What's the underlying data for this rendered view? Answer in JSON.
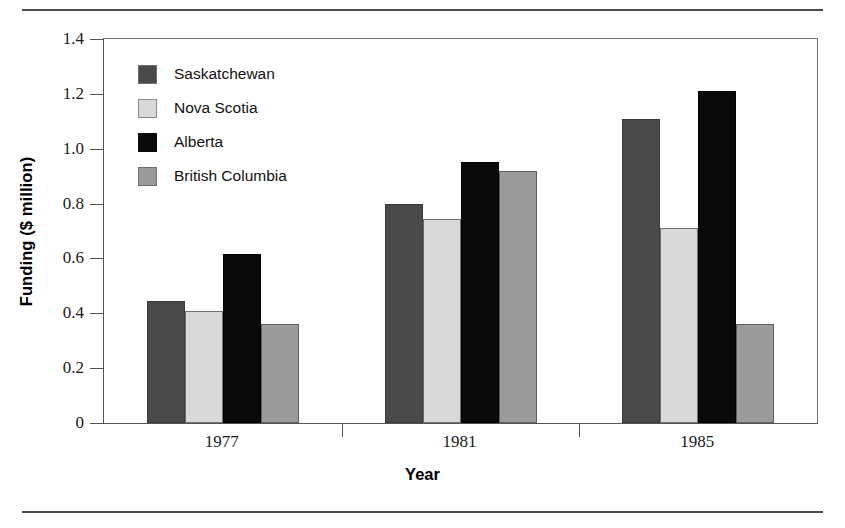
{
  "chart_data": {
    "type": "bar",
    "title": "",
    "xlabel": "Year",
    "ylabel": "Funding ($ million)",
    "categories": [
      "1977",
      "1981",
      "1985"
    ],
    "series": [
      {
        "name": "Saskatchewan",
        "color": "#4a4a4a",
        "values": [
          0.445,
          0.8,
          1.11
        ]
      },
      {
        "name": "Nova Scotia",
        "color": "#d9d9d9",
        "values": [
          0.41,
          0.745,
          0.71
        ]
      },
      {
        "name": "Alberta",
        "color": "#0a0a0a",
        "values": [
          0.615,
          0.95,
          1.21
        ]
      },
      {
        "name": "British Columbia",
        "color": "#9b9b9b",
        "values": [
          0.36,
          0.92,
          0.36
        ]
      }
    ],
    "ylim": [
      0,
      1.4
    ],
    "yticks": [
      0,
      0.2,
      0.4,
      0.6,
      0.8,
      1.0,
      1.2,
      1.4
    ],
    "ytick_labels": [
      "0",
      "0.2",
      "0.4",
      "0.6",
      "0.8",
      "1.0",
      "1.2",
      "1.4"
    ],
    "grid": false,
    "legend_position": "top-left-inside",
    "bar_orientation": "vertical",
    "grouped": true
  },
  "axes": {
    "y_title": "Funding ($ million)",
    "x_title": "Year"
  },
  "legend": {
    "entries": [
      {
        "label": "Saskatchewan",
        "swatch": "swatch-dark-gray"
      },
      {
        "label": "Nova Scotia",
        "swatch": "swatch-light-gray"
      },
      {
        "label": "Alberta",
        "swatch": "swatch-black"
      },
      {
        "label": "British Columbia",
        "swatch": "swatch-mid-gray"
      }
    ]
  }
}
